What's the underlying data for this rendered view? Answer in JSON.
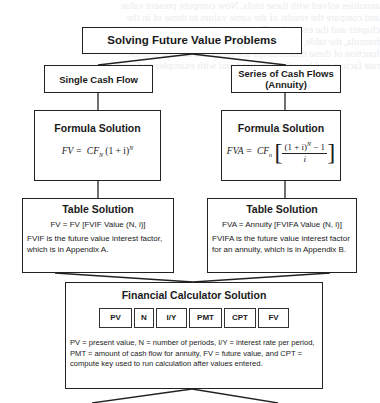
{
  "diagram": {
    "title": "Solving Future Value Problems",
    "branches": [
      {
        "label_line1": "Single Cash Flow",
        "label_line2": "",
        "formula_box": {
          "heading": "Formula Solution",
          "formula_lhs": "FV =",
          "formula_cf": "CF",
          "formula_cf_sub": "N",
          "formula_rest": "(1 + i)",
          "formula_exp": "N"
        },
        "table_box": {
          "heading": "Table Solution",
          "equation": "FV = FV [FVIF Value (N, i)]",
          "note": "FVIF is the future value interest factor, which is in Appendix A."
        }
      },
      {
        "label_line1": "Series of Cash Flows",
        "label_line2": "(Annuity)",
        "formula_box": {
          "heading": "Formula Solution",
          "formula_lhs": "FVA =",
          "formula_cf": "CF",
          "formula_cf_sub": "n",
          "formula_numerator": "(1 + i)",
          "formula_num_exp": "N",
          "formula_num_tail": " − 1",
          "formula_denominator": "i"
        },
        "table_box": {
          "heading": "Table Solution",
          "equation": "FVA = Annuity [FVIFA Value (N, i)]",
          "note": "FVIFA is the future value interest factor for an annuity, which is in Appendix B."
        }
      }
    ],
    "calculator": {
      "heading": "Financial Calculator Solution",
      "keys": [
        {
          "label": "PV",
          "width": 33
        },
        {
          "label": "N",
          "width": 20
        },
        {
          "label": "I/Y",
          "width": 31
        },
        {
          "label": "PMT",
          "width": 33
        },
        {
          "label": "CPT",
          "width": 32
        },
        {
          "label": "FV",
          "width": 31
        }
      ],
      "note": "PV = present value, N = number of periods, I/Y = interest rate per period, PMT = amount of cash flow for annuity, FV = future value, and CPT = compute key used to run calculation after values entered."
    },
    "line_color": "#222222",
    "background_bleed_text": "annuities solved with these tools. Now compute present value\nand compare the results of the same values to those of in the\nchapter and the examples. The approaches presented through the\nformula, the table, and the financial calculator in finding. The\nfunction of these relationships are presented and the interest\nrate factors and how they are used and with examples and such\n"
  }
}
